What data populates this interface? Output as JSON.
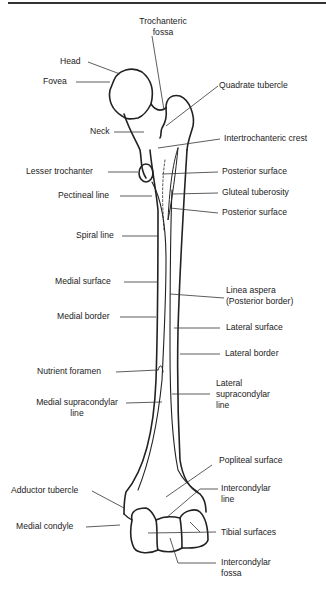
{
  "diagram": {
    "labels": {
      "trochanteric_fossa_1": "Trochanteric",
      "trochanteric_fossa_2": "fossa",
      "head": "Head",
      "fovea": "Fovea",
      "quadrate_tubercle": "Quadrate tubercle",
      "neck": "Neck",
      "intertrochanteric_crest": "Intertrochanteric crest",
      "lesser_trochanter": "Lesser trochanter",
      "posterior_surface_1": "Posterior surface",
      "pectineal_line": "Pectineal line",
      "gluteal_tuberosity": "Gluteal tuberosity",
      "posterior_surface_2": "Posterior surface",
      "spiral_line": "Spiral line",
      "medial_surface": "Medial surface",
      "linea_aspera_1": "Linea aspera",
      "linea_aspera_2": "(Posterior border)",
      "medial_border": "Medial border",
      "lateral_surface": "Lateral surface",
      "lateral_border": "Lateral border",
      "nutrient_foramen": "Nutrient foramen",
      "lateral_supracondylar_1": "Lateral",
      "lateral_supracondylar_2": "supracondylar",
      "lateral_supracondylar_3": "line",
      "medial_supracondylar_1": "Medial supracondylar",
      "medial_supracondylar_2": "line",
      "popliteal_surface": "Popliteal surface",
      "adductor_tubercle": "Adductor tubercle",
      "intercondylar_line_1": "Intercondylar",
      "intercondylar_line_2": "line",
      "medial_condyle": "Medial condyle",
      "tibial_surfaces": "Tibial surfaces",
      "intercondylar_fossa_1": "Intercondylar",
      "intercondylar_fossa_2": "fossa"
    },
    "colors": {
      "line": "#222222",
      "background": "#ffffff"
    }
  }
}
